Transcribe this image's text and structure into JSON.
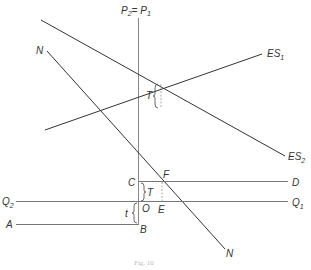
{
  "diagram": {
    "caption": "Fig. 10",
    "labels": {
      "top_axis_main": "P",
      "top_axis_sub1": "2",
      "top_axis_eq": "= P",
      "top_axis_sub2": "1",
      "n_top": "N",
      "n_bottom": "N",
      "es1_main": "ES",
      "es1_sub": "1",
      "es2_main": "ES",
      "es2_sub": "2",
      "t_upper": "T",
      "t_lower": "T",
      "t_small": "t",
      "c": "C",
      "f": "F",
      "d": "D",
      "q2_main": "Q",
      "q2_sub": "2",
      "q1_main": "Q",
      "q1_sub": "1",
      "o": "O",
      "e": "E",
      "a": "A",
      "b": "B"
    },
    "colors": {
      "line": "#333333",
      "axis": "#888888",
      "dashed": "#888888"
    }
  }
}
